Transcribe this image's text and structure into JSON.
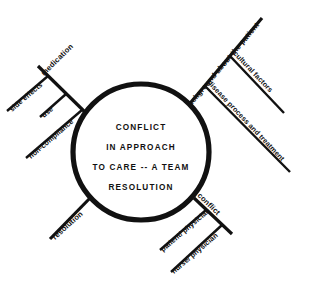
{
  "diagram": {
    "type": "fishbone-cause-and-effect",
    "hub": {
      "lines": [
        "CONFLICT",
        "IN APPROACH",
        "TO CARE -- A TEAM",
        "RESOLUTION"
      ]
    },
    "branches": [
      {
        "id": "medication",
        "label": "medication",
        "position": "upper-left",
        "sub_branches": [
          {
            "id": "side-effects",
            "label": "side effects"
          },
          {
            "id": "use",
            "label": "use"
          },
          {
            "id": "non-compliance",
            "label": "non-compliance"
          }
        ]
      },
      {
        "id": "background-about-the-patient",
        "label": "background about the patient",
        "position": "upper-right",
        "sub_branches": [
          {
            "id": "cultural-factors",
            "label": "cultural factors"
          },
          {
            "id": "disease-process-and-treatment",
            "label": "disease process and treatment"
          }
        ]
      },
      {
        "id": "conflict",
        "label": "conflict",
        "position": "lower-right",
        "sub_branches": [
          {
            "id": "patient-physician",
            "label": "patient/ physician"
          },
          {
            "id": "nurse-physician",
            "label": "nurse/ physician"
          }
        ]
      },
      {
        "id": "resolution",
        "label": "resolution",
        "position": "lower-left",
        "sub_branches": []
      }
    ],
    "colors": {
      "ink": "#111111",
      "background": "#ffffff"
    }
  }
}
